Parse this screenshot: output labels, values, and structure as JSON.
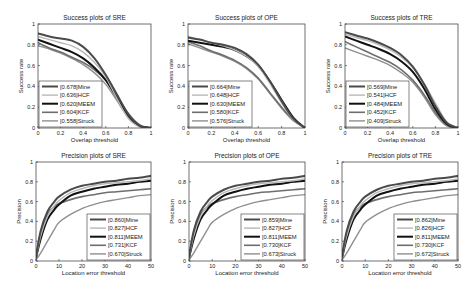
{
  "figure": {
    "layout": {
      "rows": 2,
      "cols": 3
    },
    "style": {
      "frame_color": "#333333",
      "text_color": "#222222",
      "series_styles": {
        "Mine": {
          "color": "#4a4a4a",
          "width": 2.0
        },
        "HCF": {
          "color": "#b8b8b8",
          "width": 1.4
        },
        "MEEM": {
          "color": "#111111",
          "width": 2.0
        },
        "KCF": {
          "color": "#6e6e6e",
          "width": 1.6
        },
        "Struck": {
          "color": "#8f8f8f",
          "width": 1.4
        }
      }
    }
  },
  "chart_data": [
    {
      "id": "success-sre",
      "type": "line",
      "title": "Success plots of SRE",
      "xlabel": "Overlap threshold",
      "ylabel": "Success rate",
      "xlim": [
        0,
        1
      ],
      "ylim": [
        0,
        1
      ],
      "xticks": [
        "0",
        "0.2",
        "0.4",
        "0.6",
        "0.8",
        "1"
      ],
      "yticks": [
        "0",
        "0.2",
        "0.4",
        "0.6",
        "0.8",
        "1"
      ],
      "grid": false,
      "legend_position": "lower left",
      "legend": [
        "[0.678]Mine",
        "[0.636]HCF",
        "[0.620]MEEM",
        "[0.604]KCF",
        "[0.558]Struck"
      ],
      "x": [
        0,
        0.1,
        0.2,
        0.3,
        0.4,
        0.5,
        0.6,
        0.7,
        0.8,
        0.9,
        1.0
      ],
      "series": [
        {
          "name": "Mine",
          "auc": 0.678,
          "values": [
            0.91,
            0.88,
            0.86,
            0.84,
            0.78,
            0.67,
            0.51,
            0.32,
            0.13,
            0.02,
            0.0
          ]
        },
        {
          "name": "HCF",
          "auc": 0.636,
          "values": [
            0.88,
            0.85,
            0.82,
            0.79,
            0.73,
            0.63,
            0.49,
            0.28,
            0.09,
            0.01,
            0.0
          ]
        },
        {
          "name": "MEEM",
          "auc": 0.62,
          "values": [
            0.85,
            0.81,
            0.77,
            0.73,
            0.67,
            0.58,
            0.46,
            0.29,
            0.12,
            0.02,
            0.0
          ]
        },
        {
          "name": "KCF",
          "auc": 0.604,
          "values": [
            0.82,
            0.77,
            0.73,
            0.68,
            0.63,
            0.56,
            0.46,
            0.31,
            0.14,
            0.03,
            0.0
          ]
        },
        {
          "name": "Struck",
          "auc": 0.558,
          "values": [
            0.79,
            0.76,
            0.72,
            0.67,
            0.61,
            0.53,
            0.42,
            0.26,
            0.1,
            0.02,
            0.0
          ]
        }
      ]
    },
    {
      "id": "success-ope",
      "type": "line",
      "title": "Success plots of OPE",
      "xlabel": "Overlap threshold",
      "ylabel": "Success rate",
      "xlim": [
        0,
        1
      ],
      "ylim": [
        0,
        1
      ],
      "xticks": [
        "0",
        "0.2",
        "0.4",
        "0.6",
        "0.8",
        "1"
      ],
      "yticks": [
        "0",
        "0.2",
        "0.4",
        "0.6",
        "0.8",
        "1"
      ],
      "grid": false,
      "legend_position": "lower left",
      "legend": [
        "[0.664]Mine",
        "[0.648]HCF",
        "[0.630]MEEM",
        "[0.580]KCF",
        "[0.576]Struck"
      ],
      "x": [
        0,
        0.1,
        0.2,
        0.3,
        0.4,
        0.5,
        0.6,
        0.7,
        0.8,
        0.9,
        1.0
      ],
      "series": [
        {
          "name": "Mine",
          "auc": 0.664,
          "values": [
            0.87,
            0.85,
            0.82,
            0.8,
            0.77,
            0.71,
            0.61,
            0.45,
            0.26,
            0.09,
            0.0
          ]
        },
        {
          "name": "HCF",
          "auc": 0.648,
          "values": [
            0.88,
            0.85,
            0.82,
            0.79,
            0.75,
            0.69,
            0.59,
            0.43,
            0.24,
            0.08,
            0.0
          ]
        },
        {
          "name": "MEEM",
          "auc": 0.63,
          "values": [
            0.84,
            0.82,
            0.8,
            0.78,
            0.75,
            0.69,
            0.6,
            0.45,
            0.27,
            0.1,
            0.0
          ]
        },
        {
          "name": "KCF",
          "auc": 0.58,
          "values": [
            0.83,
            0.79,
            0.74,
            0.7,
            0.65,
            0.58,
            0.48,
            0.34,
            0.2,
            0.08,
            0.0
          ]
        },
        {
          "name": "Struck",
          "auc": 0.576,
          "values": [
            0.81,
            0.77,
            0.73,
            0.69,
            0.64,
            0.57,
            0.47,
            0.33,
            0.19,
            0.07,
            0.0
          ]
        }
      ]
    },
    {
      "id": "success-tre",
      "type": "line",
      "title": "Success plots of TRE",
      "xlabel": "Overlap threshold",
      "ylabel": "Success rate",
      "xlim": [
        0,
        1
      ],
      "ylim": [
        0,
        1
      ],
      "xticks": [
        "0",
        "0.2",
        "0.4",
        "0.6",
        "0.8",
        "1"
      ],
      "yticks": [
        "0",
        "0.2",
        "0.4",
        "0.6",
        "0.8",
        "1"
      ],
      "grid": false,
      "legend_position": "lower left",
      "legend": [
        "[0.569]Mine",
        "[0.541]HCF",
        "[0.484]MEEM",
        "[0.452]KCF",
        "[0.409]Struck"
      ],
      "x": [
        0,
        0.1,
        0.2,
        0.3,
        0.4,
        0.5,
        0.6,
        0.7,
        0.8,
        0.9,
        1.0
      ],
      "series": [
        {
          "name": "Mine",
          "auc": 0.569,
          "values": [
            0.92,
            0.89,
            0.86,
            0.82,
            0.77,
            0.7,
            0.59,
            0.42,
            0.21,
            0.05,
            0.0
          ]
        },
        {
          "name": "HCF",
          "auc": 0.541,
          "values": [
            0.9,
            0.87,
            0.84,
            0.8,
            0.75,
            0.68,
            0.58,
            0.43,
            0.24,
            0.06,
            0.0
          ]
        },
        {
          "name": "MEEM",
          "auc": 0.484,
          "values": [
            0.88,
            0.84,
            0.8,
            0.76,
            0.71,
            0.64,
            0.54,
            0.38,
            0.18,
            0.04,
            0.0
          ]
        },
        {
          "name": "KCF",
          "auc": 0.452,
          "values": [
            0.83,
            0.78,
            0.73,
            0.68,
            0.63,
            0.56,
            0.46,
            0.32,
            0.15,
            0.03,
            0.0
          ]
        },
        {
          "name": "Struck",
          "auc": 0.409,
          "values": [
            0.77,
            0.73,
            0.69,
            0.65,
            0.6,
            0.53,
            0.44,
            0.3,
            0.13,
            0.02,
            0.0
          ]
        }
      ]
    },
    {
      "id": "precision-sre",
      "type": "line",
      "title": "Precision plots of SRE",
      "xlabel": "Location error threshold",
      "ylabel": "Precision",
      "xlim": [
        0,
        50
      ],
      "ylim": [
        0,
        1
      ],
      "xticks": [
        "0",
        "10",
        "20",
        "30",
        "40",
        "50"
      ],
      "yticks": [
        "0",
        "0.2",
        "0.4",
        "0.6",
        "0.8",
        "1"
      ],
      "grid": false,
      "legend_position": "lower right",
      "legend": [
        "[0.860]Mine",
        "[0.827]HCF",
        "[0.811]MEEM",
        "[0.731]KCF",
        "[0.670]Struck"
      ],
      "x": [
        0,
        2,
        5,
        8,
        10,
        15,
        20,
        25,
        30,
        35,
        40,
        45,
        50
      ],
      "series": [
        {
          "name": "Mine",
          "auc": 0.86,
          "values": [
            0.04,
            0.3,
            0.5,
            0.6,
            0.65,
            0.72,
            0.76,
            0.78,
            0.8,
            0.81,
            0.83,
            0.84,
            0.86
          ]
        },
        {
          "name": "HCF",
          "auc": 0.827,
          "values": [
            0.03,
            0.25,
            0.45,
            0.56,
            0.61,
            0.69,
            0.73,
            0.76,
            0.78,
            0.79,
            0.8,
            0.81,
            0.83
          ]
        },
        {
          "name": "MEEM",
          "auc": 0.811,
          "values": [
            0.03,
            0.22,
            0.42,
            0.52,
            0.57,
            0.66,
            0.7,
            0.73,
            0.75,
            0.77,
            0.78,
            0.8,
            0.81
          ]
        },
        {
          "name": "KCF",
          "auc": 0.731,
          "values": [
            0.04,
            0.28,
            0.47,
            0.55,
            0.58,
            0.62,
            0.65,
            0.67,
            0.69,
            0.7,
            0.71,
            0.72,
            0.73
          ]
        },
        {
          "name": "Struck",
          "auc": 0.67,
          "values": [
            0.01,
            0.08,
            0.2,
            0.32,
            0.39,
            0.47,
            0.53,
            0.57,
            0.6,
            0.62,
            0.64,
            0.66,
            0.67
          ]
        }
      ]
    },
    {
      "id": "precision-ope",
      "type": "line",
      "title": "Precision plots of OPE",
      "xlabel": "Location error threshold",
      "ylabel": "Precision",
      "xlim": [
        0,
        50
      ],
      "ylim": [
        0,
        1
      ],
      "xticks": [
        "0",
        "10",
        "20",
        "30",
        "40",
        "50"
      ],
      "yticks": [
        "0",
        "0.2",
        "0.4",
        "0.6",
        "0.8",
        "1"
      ],
      "grid": false,
      "legend_position": "lower right",
      "legend": [
        "[0.859]Mine",
        "[0.827]HCF",
        "[0.811]MEEM",
        "[0.730]KCF",
        "[0.673]Struck"
      ],
      "x": [
        0,
        2,
        5,
        8,
        10,
        15,
        20,
        25,
        30,
        35,
        40,
        45,
        50
      ],
      "series": [
        {
          "name": "Mine",
          "auc": 0.859,
          "values": [
            0.04,
            0.3,
            0.5,
            0.6,
            0.65,
            0.72,
            0.76,
            0.78,
            0.8,
            0.81,
            0.83,
            0.84,
            0.86
          ]
        },
        {
          "name": "HCF",
          "auc": 0.827,
          "values": [
            0.03,
            0.25,
            0.45,
            0.56,
            0.61,
            0.69,
            0.73,
            0.76,
            0.78,
            0.79,
            0.8,
            0.81,
            0.83
          ]
        },
        {
          "name": "MEEM",
          "auc": 0.811,
          "values": [
            0.03,
            0.22,
            0.42,
            0.52,
            0.57,
            0.66,
            0.7,
            0.73,
            0.75,
            0.77,
            0.78,
            0.8,
            0.81
          ]
        },
        {
          "name": "KCF",
          "auc": 0.73,
          "values": [
            0.04,
            0.28,
            0.47,
            0.55,
            0.58,
            0.62,
            0.65,
            0.67,
            0.69,
            0.7,
            0.71,
            0.72,
            0.73
          ]
        },
        {
          "name": "Struck",
          "auc": 0.673,
          "values": [
            0.01,
            0.08,
            0.2,
            0.32,
            0.39,
            0.47,
            0.53,
            0.57,
            0.6,
            0.62,
            0.64,
            0.66,
            0.67
          ]
        }
      ]
    },
    {
      "id": "precision-tre",
      "type": "line",
      "title": "Precision plots of TRE",
      "xlabel": "Location error threshold",
      "ylabel": "Precision",
      "xlim": [
        0,
        50
      ],
      "ylim": [
        0,
        1
      ],
      "xticks": [
        "0",
        "10",
        "20",
        "30",
        "40",
        "50"
      ],
      "yticks": [
        "0",
        "0.2",
        "0.4",
        "0.6",
        "0.8",
        "1"
      ],
      "grid": false,
      "legend_position": "lower right",
      "legend": [
        "[0.862]Mine",
        "[0.826]HCF",
        "[0.811]MEEM",
        "[0.730]KCF",
        "[0.672]Struck"
      ],
      "x": [
        0,
        2,
        5,
        8,
        10,
        15,
        20,
        25,
        30,
        35,
        40,
        45,
        50
      ],
      "series": [
        {
          "name": "Mine",
          "auc": 0.862,
          "values": [
            0.04,
            0.3,
            0.5,
            0.6,
            0.65,
            0.72,
            0.76,
            0.78,
            0.8,
            0.81,
            0.83,
            0.84,
            0.86
          ]
        },
        {
          "name": "HCF",
          "auc": 0.826,
          "values": [
            0.03,
            0.25,
            0.45,
            0.56,
            0.61,
            0.69,
            0.73,
            0.76,
            0.78,
            0.79,
            0.8,
            0.81,
            0.83
          ]
        },
        {
          "name": "MEEM",
          "auc": 0.811,
          "values": [
            0.03,
            0.22,
            0.42,
            0.52,
            0.57,
            0.66,
            0.7,
            0.73,
            0.75,
            0.77,
            0.78,
            0.8,
            0.81
          ]
        },
        {
          "name": "KCF",
          "auc": 0.73,
          "values": [
            0.04,
            0.28,
            0.47,
            0.55,
            0.58,
            0.62,
            0.65,
            0.67,
            0.69,
            0.7,
            0.71,
            0.72,
            0.73
          ]
        },
        {
          "name": "Struck",
          "auc": 0.672,
          "values": [
            0.01,
            0.08,
            0.2,
            0.32,
            0.39,
            0.47,
            0.53,
            0.57,
            0.6,
            0.62,
            0.64,
            0.66,
            0.67
          ]
        }
      ]
    }
  ]
}
